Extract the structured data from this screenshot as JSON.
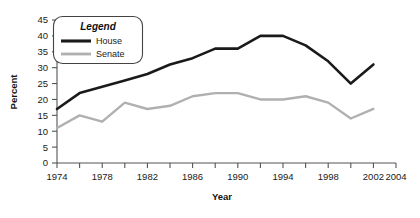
{
  "chart_data": {
    "type": "line",
    "title": "",
    "xlabel": "Year",
    "ylabel": "Percent",
    "xlim": [
      1974,
      2004
    ],
    "ylim": [
      0,
      45
    ],
    "grid": false,
    "legend_position": "top-left",
    "legend_title": "Legend",
    "x_tick_labels": [
      "1974",
      "1978",
      "1982",
      "1986",
      "1990",
      "1994",
      "1998",
      "2002",
      "2004"
    ],
    "x_tick_values": [
      1974,
      1978,
      1982,
      1986,
      1990,
      1994,
      1998,
      2002,
      2004
    ],
    "x_minor_tick_values": [
      1976,
      1980,
      1984,
      1988,
      1992,
      1996,
      2000
    ],
    "y_tick_labels": [
      "0",
      "5",
      "10",
      "15",
      "20",
      "25",
      "30",
      "35",
      "40",
      "45"
    ],
    "y_tick_values": [
      0,
      5,
      10,
      15,
      20,
      25,
      30,
      35,
      40,
      45
    ],
    "x": [
      1974,
      1976,
      1978,
      1980,
      1982,
      1984,
      1986,
      1988,
      1990,
      1992,
      1994,
      1996,
      1998,
      2000,
      2002
    ],
    "series": [
      {
        "name": "House",
        "color": "#1a1a1a",
        "values": [
          17,
          22,
          24,
          26,
          28,
          31,
          33,
          36,
          36,
          40,
          40,
          37,
          32,
          25,
          31
        ]
      },
      {
        "name": "Senate",
        "color": "#b0b0b0",
        "values": [
          11,
          15,
          13,
          19,
          17,
          18,
          21,
          22,
          22,
          20,
          20,
          21,
          19,
          14,
          17
        ]
      }
    ]
  },
  "axes": {
    "y_axis_title": "Percent",
    "x_axis_title": "Year"
  },
  "legend": {
    "title": "Legend",
    "entries": [
      {
        "label": "House",
        "color": "#1a1a1a"
      },
      {
        "label": "Senate",
        "color": "#b0b0b0"
      }
    ]
  },
  "colors": {
    "house": "#1a1a1a",
    "senate": "#b0b0b0",
    "axis": "#555555",
    "background": "#ffffff"
  }
}
